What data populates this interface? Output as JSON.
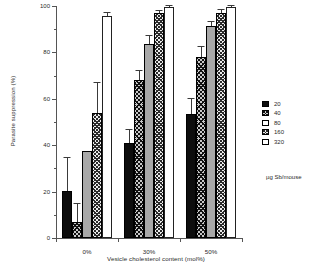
{
  "chart_data": {
    "type": "bar",
    "title": "",
    "xlabel": "Vesicle cholesterol content (mol%)",
    "ylabel": "Parasite suppression (%)",
    "categories": [
      "0%",
      "30%",
      "50%"
    ],
    "ylim": [
      0,
      100
    ],
    "yticks": [
      0,
      20,
      40,
      60,
      80,
      100
    ],
    "yticklabels": [
      "0",
      "20",
      "40",
      "60",
      "80",
      "100"
    ],
    "grid": false,
    "legend_position": "right",
    "legend_title": "µg Sb/mouse",
    "series": [
      {
        "name": "20",
        "pattern": "solid-black",
        "color": "#0d0d0d",
        "values": [
          20.3,
          41.0,
          53.5
        ],
        "errors": [
          14.0,
          5.5,
          6.5
        ]
      },
      {
        "name": "40",
        "pattern": "dark-crosshatch",
        "color": "#c9c9c9",
        "values": [
          7.0,
          68.0,
          78.0
        ],
        "errors": [
          7.5,
          4.0,
          4.5
        ]
      },
      {
        "name": "80",
        "pattern": "solid-gray",
        "color": "#a8a8a8",
        "values": [
          37.3,
          83.7,
          91.3
        ],
        "errors": [
          0.0,
          3.5,
          1.8
        ]
      },
      {
        "name": "160",
        "pattern": "light-crosshatch",
        "color": "#ededed",
        "values": [
          54.0,
          96.8,
          97.2
        ],
        "errors": [
          13.0,
          1.0,
          1.0
        ]
      },
      {
        "name": "320",
        "pattern": "white",
        "color": "#ffffff",
        "values": [
          95.8,
          99.4,
          99.6
        ],
        "errors": [
          1.0,
          0.5,
          0.4
        ]
      }
    ]
  },
  "legend": {
    "title": "µg Sb/mouse",
    "items": [
      {
        "label": "20"
      },
      {
        "label": "40"
      },
      {
        "label": "80"
      },
      {
        "label": "160"
      },
      {
        "label": "320"
      }
    ]
  }
}
